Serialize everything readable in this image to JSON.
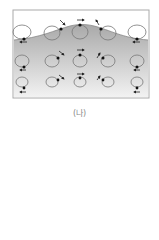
{
  "figure": {
    "caption": "(나)",
    "colors": {
      "water_top": "#a9a9a9",
      "water_bottom": "#f2f2f2",
      "orbit": "#777777",
      "particle": "#111111",
      "frame": "#aaaaaa"
    },
    "rows": [
      {
        "name": "surface",
        "y": 32,
        "rx": 9,
        "ry": 8
      },
      {
        "name": "middle",
        "y": 61,
        "rx": 7,
        "ry": 6
      },
      {
        "name": "bottom",
        "y": 82,
        "rx": 6,
        "ry": 5
      }
    ],
    "columns": [
      24,
      57,
      80,
      103,
      136
    ]
  }
}
